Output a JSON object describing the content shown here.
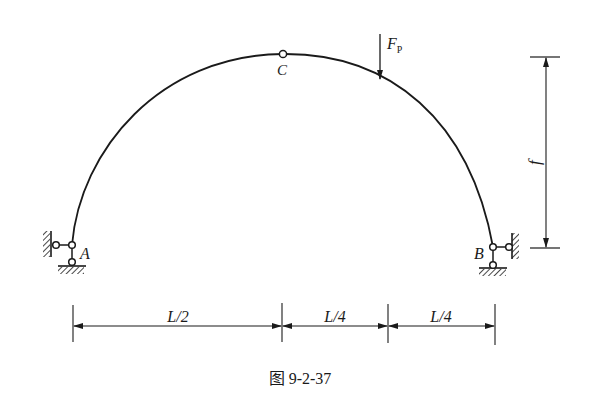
{
  "figure": {
    "caption": "图 9-2-37",
    "type": "three-hinged arch",
    "colors": {
      "line": "#1a1a1a",
      "background": "#ffffff"
    }
  },
  "labels": {
    "support_left": "A",
    "support_right": "B",
    "crown_hinge": "C",
    "load": "F",
    "load_subscript": "P",
    "rise": "f"
  },
  "dimensions": {
    "segments": [
      {
        "label": "L/2"
      },
      {
        "label": "L/4"
      },
      {
        "label": "L/4"
      }
    ]
  }
}
